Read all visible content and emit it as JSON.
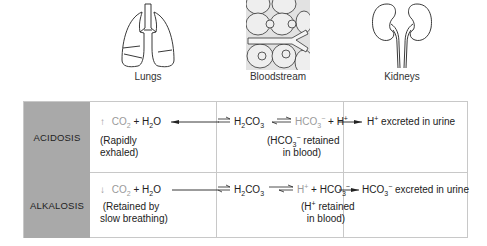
{
  "organs": [
    {
      "label": "Lungs"
    },
    {
      "label": "Bloodstream"
    },
    {
      "label": "Kidneys"
    }
  ],
  "rows": [
    {
      "header": "ACIDOSIS",
      "lungs": {
        "arrow": "↑",
        "co2": "CO",
        "co2_sub": "2",
        "plus_water": "+ H",
        "water_sub": "2",
        "water_o": "O",
        "note_line1": "(Rapidly",
        "note_line2": "exhaled)"
      },
      "blood": {
        "h2": "H",
        "h2_sub": "2",
        "co3": "CO",
        "co3_sub": "3",
        "product1": "HCO",
        "product1_sub": "3",
        "product1_sup": "−",
        "plus": "+ H",
        "product2_sup": "+",
        "note_line1_a": "(HCO",
        "note_line1_sub": "3",
        "note_line1_sup": "−",
        "note_line1_b": " retained",
        "note_line2": "in blood)"
      },
      "kidneys": {
        "ion": "H",
        "ion_sup": "+",
        "text": " excreted in urine"
      }
    },
    {
      "header": "ALKALOSIS",
      "lungs": {
        "arrow": "↓",
        "co2": "CO",
        "co2_sub": "2",
        "plus_water": "+ H",
        "water_sub": "2",
        "water_o": "O",
        "note_line1": "(Retained by",
        "note_line2": "slow breathing)"
      },
      "blood": {
        "h2": "H",
        "h2_sub": "2",
        "co3": "CO",
        "co3_sub": "3",
        "product1": "H",
        "product1_sup": "+",
        "plus": "+ HCO",
        "product2_sub": "3",
        "product2_sup": "−",
        "note_line1_a": "(H",
        "note_line1_sup": "+",
        "note_line1_b": " retained",
        "note_line2": "in blood)"
      },
      "kidneys": {
        "ion": "HCO",
        "ion_sub": "3",
        "ion_sup": "−",
        "text": " excreted in urine"
      }
    }
  ]
}
